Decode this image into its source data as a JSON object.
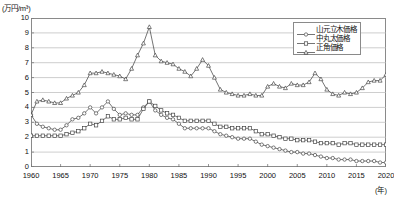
{
  "chart_data": {
    "type": "line",
    "title": "",
    "xlabel": "年",
    "ylabel": "万円/m³",
    "y_unit_label": "(万円/m³)",
    "x_unit_label": "(年)",
    "xlim": [
      1960,
      2020
    ],
    "ylim": [
      0,
      10
    ],
    "grid": true,
    "grid_axis": "y",
    "legend_position": "top-right",
    "yticks": [
      0,
      1,
      2,
      3,
      4,
      5,
      6,
      7,
      8,
      9,
      10
    ],
    "xticks": [
      1960,
      1965,
      1970,
      1975,
      1980,
      1985,
      1990,
      1995,
      2000,
      2005,
      2010,
      2015,
      2020
    ],
    "x": [
      1960,
      1961,
      1962,
      1963,
      1964,
      1965,
      1966,
      1967,
      1968,
      1969,
      1970,
      1971,
      1972,
      1973,
      1974,
      1975,
      1976,
      1977,
      1978,
      1979,
      1980,
      1981,
      1982,
      1983,
      1984,
      1985,
      1986,
      1987,
      1988,
      1989,
      1990,
      1991,
      1992,
      1993,
      1994,
      1995,
      1996,
      1997,
      1998,
      1999,
      2000,
      2001,
      2002,
      2003,
      2004,
      2005,
      2006,
      2007,
      2008,
      2009,
      2010,
      2011,
      2012,
      2013,
      2014,
      2015,
      2016,
      2017,
      2018,
      2019,
      2020
    ],
    "series": [
      {
        "name": "山元立木価格",
        "marker": "circle-open",
        "values": [
          3.5,
          2.9,
          2.7,
          2.6,
          2.5,
          2.5,
          2.8,
          3.2,
          3.3,
          3.6,
          4.0,
          3.6,
          4.0,
          4.4,
          3.9,
          3.5,
          3.6,
          3.5,
          3.5,
          4.0,
          4.4,
          3.8,
          3.5,
          3.3,
          3.2,
          2.9,
          2.6,
          2.6,
          2.6,
          2.6,
          2.6,
          2.4,
          2.2,
          2.1,
          2.0,
          1.9,
          1.9,
          1.9,
          1.7,
          1.5,
          1.4,
          1.3,
          1.2,
          1.1,
          1.0,
          1.0,
          0.9,
          0.9,
          0.8,
          0.7,
          0.6,
          0.6,
          0.5,
          0.5,
          0.5,
          0.4,
          0.4,
          0.4,
          0.4,
          0.3,
          0.3
        ]
      },
      {
        "name": "中丸太価格",
        "marker": "square-open",
        "values": [
          2.1,
          2.1,
          2.1,
          2.1,
          2.1,
          2.1,
          2.2,
          2.3,
          2.4,
          2.6,
          2.9,
          2.8,
          3.1,
          3.4,
          3.2,
          3.2,
          3.3,
          3.2,
          3.2,
          3.9,
          4.4,
          4.1,
          3.8,
          3.6,
          3.5,
          3.3,
          3.1,
          3.1,
          3.1,
          3.1,
          3.1,
          2.9,
          2.7,
          2.7,
          2.6,
          2.6,
          2.6,
          2.6,
          2.4,
          2.2,
          2.2,
          2.1,
          2.0,
          1.9,
          1.9,
          1.8,
          1.8,
          1.8,
          1.7,
          1.6,
          1.6,
          1.6,
          1.5,
          1.6,
          1.6,
          1.5,
          1.5,
          1.5,
          1.5,
          1.5,
          1.5
        ]
      },
      {
        "name": "正角価格",
        "marker": "triangle-open",
        "values": [
          3.5,
          4.4,
          4.5,
          4.4,
          4.3,
          4.3,
          4.6,
          4.8,
          5.0,
          5.5,
          6.3,
          6.3,
          6.4,
          6.3,
          6.2,
          6.1,
          5.9,
          6.6,
          7.5,
          8.3,
          9.4,
          7.5,
          7.1,
          7.0,
          6.9,
          6.6,
          6.4,
          6.1,
          6.6,
          7.2,
          6.8,
          6.0,
          5.2,
          5.0,
          4.9,
          4.8,
          4.8,
          4.9,
          4.8,
          4.8,
          5.4,
          5.6,
          5.4,
          5.3,
          5.6,
          5.5,
          5.5,
          5.7,
          6.3,
          5.9,
          5.2,
          4.9,
          4.8,
          5.0,
          4.9,
          5.0,
          5.3,
          5.7,
          5.8,
          5.8,
          6.2
        ]
      }
    ]
  },
  "legend": {
    "items": [
      {
        "label": "山元立木価格",
        "marker": "circle-open"
      },
      {
        "label": "中丸太価格",
        "marker": "square-open"
      },
      {
        "label": "正角価格",
        "marker": "triangle-open"
      }
    ]
  }
}
